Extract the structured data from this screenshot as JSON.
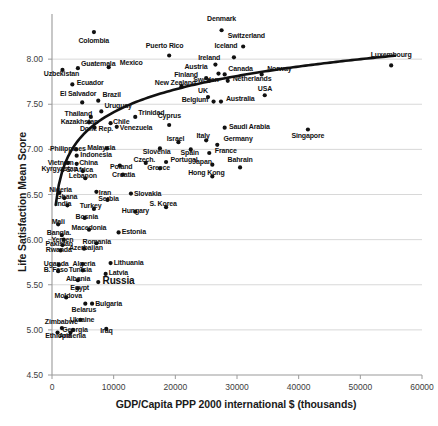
{
  "chart_data": {
    "type": "scatter",
    "title": "",
    "xlabel": "GDP/Capita PPP 2000 international $ (thousands)",
    "ylabel": "Life Satisfaction Mean Score",
    "xlim": [
      0,
      60000
    ],
    "ylim": [
      4.5,
      8.5
    ],
    "xticks": [
      0,
      10000,
      20000,
      30000,
      40000,
      50000,
      60000
    ],
    "xtick_labels": [
      "0",
      "10000",
      "20000",
      "30000",
      "40000",
      "50000",
      "60000"
    ],
    "yticks": [
      4.5,
      5.0,
      5.5,
      6.0,
      6.5,
      7.0,
      7.5,
      8.0
    ],
    "ytick_labels": [
      "4.50",
      "5.00",
      "5.50",
      "6.00",
      "6.50",
      "7.00",
      "7.50",
      "8.00"
    ],
    "grid": "horizontal",
    "legend": "none",
    "marker_color": "#111111",
    "trendline": {
      "type": "logarithmic",
      "color": "#111111",
      "width": 2.6
    },
    "points": [
      {
        "label": "Colombia",
        "x": 6800,
        "y": 8.3,
        "lx": 6800,
        "ly": 8.2,
        "anchor": "center"
      },
      {
        "label": "Denmark",
        "x": 27500,
        "y": 8.32,
        "lx": 27500,
        "ly": 8.45,
        "anchor": "center"
      },
      {
        "label": "Puerto Rico",
        "x": 19000,
        "y": 8.04,
        "lx": 18300,
        "ly": 8.14,
        "anchor": "center"
      },
      {
        "label": "Iceland",
        "x": 29500,
        "y": 8.02,
        "lx": 28200,
        "ly": 8.14,
        "anchor": "center"
      },
      {
        "label": "Switzerland",
        "x": 31000,
        "y": 8.14,
        "lx": 31500,
        "ly": 8.26,
        "anchor": "center"
      },
      {
        "label": "Luxembourg",
        "x": 55000,
        "y": 7.93,
        "lx": 55000,
        "ly": 8.05,
        "anchor": "center"
      },
      {
        "label": "Mexico",
        "x": 9200,
        "y": 7.91,
        "lx": 11000,
        "ly": 7.96,
        "anchor": "left"
      },
      {
        "label": "Guatemala",
        "x": 4200,
        "y": 7.9,
        "lx": 4700,
        "ly": 7.95,
        "anchor": "left"
      },
      {
        "label": "Uzbekistan",
        "x": 1700,
        "y": 7.88,
        "lx": 1500,
        "ly": 7.83,
        "anchor": "center"
      },
      {
        "label": "Ireland",
        "x": 26500,
        "y": 7.94,
        "lx": 25500,
        "ly": 8.01,
        "anchor": "center"
      },
      {
        "label": "Austria",
        "x": 27000,
        "y": 7.84,
        "lx": 25200,
        "ly": 7.91,
        "anchor": "right"
      },
      {
        "label": "Canada",
        "x": 28000,
        "y": 7.83,
        "lx": 28600,
        "ly": 7.89,
        "anchor": "left"
      },
      {
        "label": "Norway",
        "x": 34000,
        "y": 7.83,
        "lx": 34900,
        "ly": 7.89,
        "anchor": "left"
      },
      {
        "label": "Finland",
        "x": 25000,
        "y": 7.79,
        "lx": 23700,
        "ly": 7.82,
        "anchor": "right"
      },
      {
        "label": "Sweden",
        "x": 25500,
        "y": 7.76,
        "lx": 25000,
        "ly": 7.77,
        "anchor": "center"
      },
      {
        "label": "Netherlands",
        "x": 28500,
        "y": 7.76,
        "lx": 29300,
        "ly": 7.78,
        "anchor": "left"
      },
      {
        "label": "Ecuador",
        "x": 3300,
        "y": 7.72,
        "lx": 4000,
        "ly": 7.73,
        "anchor": "left"
      },
      {
        "label": "New Zealand",
        "x": 21000,
        "y": 7.7,
        "lx": 20000,
        "ly": 7.73,
        "anchor": "center"
      },
      {
        "label": "El Salvador",
        "x": 4900,
        "y": 7.52,
        "lx": 4200,
        "ly": 7.61,
        "anchor": "center"
      },
      {
        "label": "Brazil",
        "x": 7500,
        "y": 7.54,
        "lx": 8200,
        "ly": 7.6,
        "anchor": "left"
      },
      {
        "label": "UK",
        "x": 25300,
        "y": 7.58,
        "lx": 24500,
        "ly": 7.65,
        "anchor": "center"
      },
      {
        "label": "USA",
        "x": 34500,
        "y": 7.6,
        "lx": 34500,
        "ly": 7.67,
        "anchor": "center"
      },
      {
        "label": "Belgium",
        "x": 26200,
        "y": 7.53,
        "lx": 25400,
        "ly": 7.55,
        "anchor": "right"
      },
      {
        "label": "Australia",
        "x": 27400,
        "y": 7.53,
        "lx": 28200,
        "ly": 7.56,
        "anchor": "left"
      },
      {
        "label": "Uruguay",
        "x": 8000,
        "y": 7.42,
        "lx": 8500,
        "ly": 7.48,
        "anchor": "left"
      },
      {
        "label": "Thailand",
        "x": 6300,
        "y": 7.36,
        "lx": 4300,
        "ly": 7.39,
        "anchor": "center"
      },
      {
        "label": "Trinidad",
        "x": 13500,
        "y": 7.36,
        "lx": 14000,
        "ly": 7.4,
        "anchor": "left"
      },
      {
        "label": "Cyprus",
        "x": 19000,
        "y": 7.27,
        "lx": 19000,
        "ly": 7.37,
        "anchor": "center"
      },
      {
        "label": "Kazakhstan",
        "x": 6000,
        "y": 7.3,
        "lx": 4400,
        "ly": 7.3,
        "anchor": "center"
      },
      {
        "label": "Chile",
        "x": 9500,
        "y": 7.29,
        "lx": 9900,
        "ly": 7.3,
        "anchor": "left"
      },
      {
        "label": "Dom. Rep.",
        "x": 6900,
        "y": 7.24,
        "lx": 7200,
        "ly": 7.23,
        "anchor": "center"
      },
      {
        "label": "Venezuela",
        "x": 10500,
        "y": 7.25,
        "lx": 11000,
        "ly": 7.24,
        "anchor": "left"
      },
      {
        "label": "Israel",
        "x": 20500,
        "y": 7.08,
        "lx": 20000,
        "ly": 7.12,
        "anchor": "center"
      },
      {
        "label": "Italy",
        "x": 25000,
        "y": 7.1,
        "lx": 24500,
        "ly": 7.15,
        "anchor": "center"
      },
      {
        "label": "Germany",
        "x": 26800,
        "y": 7.05,
        "lx": 27800,
        "ly": 7.11,
        "anchor": "left"
      },
      {
        "label": "Saudi Arabia",
        "x": 28000,
        "y": 7.24,
        "lx": 28700,
        "ly": 7.25,
        "anchor": "left"
      },
      {
        "label": "Singapore",
        "x": 41500,
        "y": 7.22,
        "lx": 41500,
        "ly": 7.15,
        "anchor": "center"
      },
      {
        "label": "Philippines",
        "x": 3900,
        "y": 7.0,
        "lx": 2600,
        "ly": 7.0,
        "anchor": "center"
      },
      {
        "label": "Malaysia",
        "x": 8900,
        "y": 7.01,
        "lx": 8000,
        "ly": 7.02,
        "anchor": "center"
      },
      {
        "label": "Slovenia",
        "x": 17500,
        "y": 7.01,
        "lx": 17000,
        "ly": 6.97,
        "anchor": "center"
      },
      {
        "label": "Spain",
        "x": 22500,
        "y": 7.0,
        "lx": 22300,
        "ly": 6.96,
        "anchor": "center"
      },
      {
        "label": "France",
        "x": 25500,
        "y": 6.96,
        "lx": 26400,
        "ly": 6.98,
        "anchor": "left"
      },
      {
        "label": "Indonesia",
        "x": 4000,
        "y": 6.93,
        "lx": 4600,
        "ly": 6.94,
        "anchor": "left"
      },
      {
        "label": "Vietnam",
        "x": 2600,
        "y": 6.85,
        "lx": 1400,
        "ly": 6.85,
        "anchor": "center"
      },
      {
        "label": "China",
        "x": 4000,
        "y": 6.84,
        "lx": 4400,
        "ly": 6.85,
        "anchor": "left"
      },
      {
        "label": "Czech.",
        "x": 15200,
        "y": 6.85,
        "lx": 15000,
        "ly": 6.88,
        "anchor": "center"
      },
      {
        "label": "Portugal",
        "x": 18500,
        "y": 6.86,
        "lx": 19200,
        "ly": 6.88,
        "anchor": "left"
      },
      {
        "label": "Japan",
        "x": 26000,
        "y": 6.83,
        "lx": 24300,
        "ly": 6.86,
        "anchor": "center"
      },
      {
        "label": "Poland",
        "x": 11000,
        "y": 6.82,
        "lx": 11200,
        "ly": 6.8,
        "anchor": "center"
      },
      {
        "label": "Greece",
        "x": 17500,
        "y": 6.79,
        "lx": 17300,
        "ly": 6.79,
        "anchor": "center"
      },
      {
        "label": "Kyrgyzstan",
        "x": 1700,
        "y": 6.77,
        "lx": 1200,
        "ly": 6.78,
        "anchor": "center"
      },
      {
        "label": "S. Africa",
        "x": 5000,
        "y": 6.76,
        "lx": 4500,
        "ly": 6.77,
        "anchor": "center"
      },
      {
        "label": "Hong Kong",
        "x": 26000,
        "y": 6.7,
        "lx": 25000,
        "ly": 6.74,
        "anchor": "center"
      },
      {
        "label": "Croatia",
        "x": 11500,
        "y": 6.72,
        "lx": 11600,
        "ly": 6.72,
        "anchor": "center"
      },
      {
        "label": "Lebanon",
        "x": 5400,
        "y": 6.68,
        "lx": 5000,
        "ly": 6.7,
        "anchor": "center"
      },
      {
        "label": "Bahrain",
        "x": 30500,
        "y": 6.8,
        "lx": 30500,
        "ly": 6.88,
        "anchor": "center"
      },
      {
        "label": "Nigeria",
        "x": 1200,
        "y": 6.52,
        "lx": 1400,
        "ly": 6.55,
        "anchor": "center"
      },
      {
        "label": "Iran",
        "x": 7200,
        "y": 6.53,
        "lx": 7600,
        "ly": 6.52,
        "anchor": "left"
      },
      {
        "label": "Slovakia",
        "x": 12800,
        "y": 6.51,
        "lx": 13300,
        "ly": 6.51,
        "anchor": "left"
      },
      {
        "label": "Ghana",
        "x": 2000,
        "y": 6.46,
        "lx": 2400,
        "ly": 6.47,
        "anchor": "center"
      },
      {
        "label": "Serbia",
        "x": 9000,
        "y": 6.44,
        "lx": 9200,
        "ly": 6.45,
        "anchor": "center"
      },
      {
        "label": "India",
        "x": 2500,
        "y": 6.38,
        "lx": 1900,
        "ly": 6.4,
        "anchor": "center"
      },
      {
        "label": "Turkey",
        "x": 6800,
        "y": 6.34,
        "lx": 6300,
        "ly": 6.37,
        "anchor": "center"
      },
      {
        "label": "S. Korea",
        "x": 18500,
        "y": 6.36,
        "lx": 18000,
        "ly": 6.39,
        "anchor": "center"
      },
      {
        "label": "Hungary",
        "x": 13500,
        "y": 6.31,
        "lx": 13500,
        "ly": 6.32,
        "anchor": "center"
      },
      {
        "label": "Bosnia",
        "x": 5300,
        "y": 6.24,
        "lx": 5600,
        "ly": 6.25,
        "anchor": "center"
      },
      {
        "label": "Mali",
        "x": 1000,
        "y": 6.17,
        "lx": 1000,
        "ly": 6.2,
        "anchor": "center"
      },
      {
        "label": "Macedonia",
        "x": 6000,
        "y": 6.11,
        "lx": 6000,
        "ly": 6.13,
        "anchor": "center"
      },
      {
        "label": "Estonia",
        "x": 10800,
        "y": 6.08,
        "lx": 11300,
        "ly": 6.08,
        "anchor": "left"
      },
      {
        "label": "Bangla.",
        "x": 1600,
        "y": 6.05,
        "lx": 1100,
        "ly": 6.07,
        "anchor": "center"
      },
      {
        "label": "Yemen",
        "x": 1900,
        "y": 6.0,
        "lx": 1700,
        "ly": 6.0,
        "anchor": "center"
      },
      {
        "label": "Romania",
        "x": 7200,
        "y": 5.96,
        "lx": 7300,
        "ly": 5.97,
        "anchor": "center"
      },
      {
        "label": "Pakistan",
        "x": 1700,
        "y": 5.94,
        "lx": 1200,
        "ly": 5.95,
        "anchor": "center"
      },
      {
        "label": "Azerbaijan",
        "x": 5200,
        "y": 5.9,
        "lx": 5500,
        "ly": 5.91,
        "anchor": "center"
      },
      {
        "label": "Rwanda",
        "x": 1400,
        "y": 5.88,
        "lx": 1100,
        "ly": 5.89,
        "anchor": "center"
      },
      {
        "label": "Uganda",
        "x": 1100,
        "y": 5.72,
        "lx": 700,
        "ly": 5.73,
        "anchor": "center"
      },
      {
        "label": "Algeria",
        "x": 5000,
        "y": 5.73,
        "lx": 5200,
        "ly": 5.73,
        "anchor": "center"
      },
      {
        "label": "Lithuania",
        "x": 9500,
        "y": 5.74,
        "lx": 10000,
        "ly": 5.74,
        "anchor": "left"
      },
      {
        "label": "B. Faso",
        "x": 1000,
        "y": 5.65,
        "lx": 600,
        "ly": 5.66,
        "anchor": "center"
      },
      {
        "label": "Tunisia",
        "x": 5000,
        "y": 5.66,
        "lx": 4600,
        "ly": 5.66,
        "anchor": "center"
      },
      {
        "label": "Latvia",
        "x": 8700,
        "y": 5.62,
        "lx": 9200,
        "ly": 5.63,
        "anchor": "left"
      },
      {
        "label": "Albania",
        "x": 4200,
        "y": 5.55,
        "lx": 4200,
        "ly": 5.56,
        "anchor": "center"
      },
      {
        "label": "Russia",
        "x": 7500,
        "y": 5.53,
        "lx": 8200,
        "ly": 5.53,
        "anchor": "left",
        "big": true
      },
      {
        "label": "Egypt",
        "x": 4200,
        "y": 5.46,
        "lx": 4500,
        "ly": 5.46,
        "anchor": "center"
      },
      {
        "label": "Moldova",
        "x": 2300,
        "y": 5.36,
        "lx": 2600,
        "ly": 5.37,
        "anchor": "center"
      },
      {
        "label": "Bulgaria",
        "x": 6500,
        "y": 5.29,
        "lx": 7000,
        "ly": 5.29,
        "anchor": "left"
      },
      {
        "label": "Belarus",
        "x": 5400,
        "y": 5.29,
        "lx": 5200,
        "ly": 5.22,
        "anchor": "center"
      },
      {
        "label": "Ukraine",
        "x": 4600,
        "y": 5.11,
        "lx": 4900,
        "ly": 5.11,
        "anchor": "center"
      },
      {
        "label": "Zimbabwe",
        "x": 1600,
        "y": 5.02,
        "lx": 1500,
        "ly": 5.09,
        "anchor": "center"
      },
      {
        "label": "Georgia",
        "x": 3400,
        "y": 5.0,
        "lx": 3700,
        "ly": 5.0,
        "anchor": "center"
      },
      {
        "label": "Iraq",
        "x": 8800,
        "y": 5.01,
        "lx": 8800,
        "ly": 4.99,
        "anchor": "center"
      },
      {
        "label": "Ethiopia",
        "x": 900,
        "y": 4.97,
        "lx": 1000,
        "ly": 4.93,
        "anchor": "center"
      },
      {
        "label": "Armenia",
        "x": 3000,
        "y": 4.97,
        "lx": 3300,
        "ly": 4.93,
        "anchor": "center"
      }
    ]
  },
  "axes": {
    "y_title": "Life Satisfaction Mean Score",
    "x_title": "GDP/Capita PPP 2000 international $ (thousands)"
  }
}
